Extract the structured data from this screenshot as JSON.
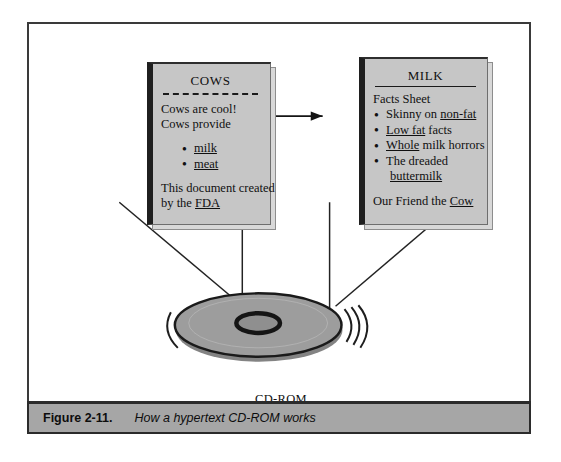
{
  "figure": {
    "caption_label": "Figure 2-11.",
    "caption_text": "How a hypertext CD-ROM works",
    "media_label": "CD-ROM",
    "frame_color": "#3a3a3a",
    "caption_bar_color": "#a6a6a6"
  },
  "cards": {
    "cows": {
      "title": "COWS",
      "rule_style": "dashed",
      "lines": [
        "Cows are cool!",
        "Cows provide"
      ],
      "bullets": [
        {
          "text": "milk",
          "link": "milk"
        },
        {
          "text": "meat",
          "link": "meat"
        }
      ],
      "footer_line1": "This document created",
      "footer_line2_prefix": "by the ",
      "footer_line2_link": "FDA"
    },
    "milk": {
      "title": "MILK",
      "rule_style": "solid",
      "lines": [
        "Facts Sheet"
      ],
      "bullets": [
        {
          "prefix": "Skinny on ",
          "link": "non-fat",
          "suffix": ""
        },
        {
          "prefix": "",
          "link": "Low fat",
          "suffix": " facts"
        },
        {
          "prefix": "",
          "link": "Whole",
          "suffix": " milk horrors"
        },
        {
          "prefix": "The dreaded",
          "link": "buttermilk",
          "suffix": "",
          "wrap": true
        }
      ],
      "footer_prefix": "Our Friend the ",
      "footer_link": "Cow"
    }
  },
  "icons": {
    "arrow": "arrow-right-icon",
    "disc": "cd-rom-disc-icon",
    "bullet": "bullet-dot-icon"
  }
}
